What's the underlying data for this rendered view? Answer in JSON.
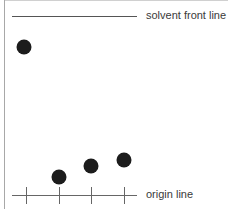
{
  "diagram": {
    "type": "thin-layer-chromatography",
    "solvent_front": {
      "label": "solvent front line",
      "y": 16,
      "x1": 12,
      "x2": 137
    },
    "origin": {
      "label": "origin line",
      "y": 195,
      "x1": 12,
      "x2": 137,
      "ticks": [
        26,
        59,
        91,
        124
      ]
    },
    "spots": [
      {
        "x": 24,
        "y": 47,
        "r": 7.5
      },
      {
        "x": 59,
        "y": 177,
        "r": 7.5
      },
      {
        "x": 91,
        "y": 166,
        "r": 7.5
      },
      {
        "x": 124,
        "y": 160,
        "r": 7.5
      }
    ],
    "colors": {
      "line": "#555555",
      "spot": "#1c1c1c",
      "border": "#b0b0b0",
      "text": "#3a3a3a"
    }
  }
}
